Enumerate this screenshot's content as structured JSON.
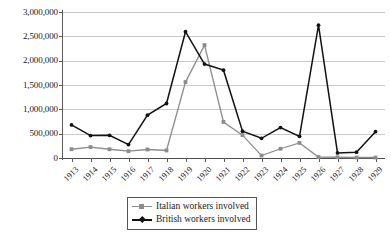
{
  "chart_data": {
    "type": "line",
    "title": "",
    "subtitle": "",
    "xlabel": "",
    "ylabel": "",
    "ylim": [
      0,
      3000000
    ],
    "grid": true,
    "legend_position": "bottom-center",
    "categories": [
      "1913",
      "1914",
      "1915",
      "1916",
      "1917",
      "1918",
      "1919",
      "1920",
      "1921",
      "1922",
      "1923",
      "1924",
      "1925",
      "1926",
      "1927",
      "1928",
      "1929"
    ],
    "ytick_labels": [
      "3,000,000",
      "2,500,000",
      "2,000,000",
      "1,500,000",
      "1,000,000",
      "500,000",
      "0"
    ],
    "ytick_values": [
      3000000,
      2500000,
      2000000,
      1500000,
      1000000,
      500000,
      0
    ],
    "series": [
      {
        "name": "Italian workers involved",
        "color": "#8c8c8c",
        "marker": "square",
        "values": [
          180000,
          225000,
          180000,
          140000,
          175000,
          155000,
          1560000,
          2320000,
          740000,
          470000,
          50000,
          190000,
          310000,
          20000,
          15000,
          10000,
          10000
        ]
      },
      {
        "name": "British workers involved",
        "color": "#121212",
        "marker": "diamond",
        "values": [
          680000,
          460000,
          465000,
          275000,
          880000,
          1120000,
          2595000,
          1930000,
          1805000,
          550000,
          405000,
          625000,
          445000,
          2730000,
          105000,
          120000,
          540000
        ]
      }
    ]
  },
  "legend": {
    "items": [
      {
        "label": "Italian workers involved"
      },
      {
        "label": "British workers involved"
      }
    ]
  },
  "colors": {
    "italian": "#8c8c8c",
    "british": "#121212",
    "gridline": "#c9c9c9",
    "axis": "#5a5a5a",
    "background": "#ffffff"
  }
}
